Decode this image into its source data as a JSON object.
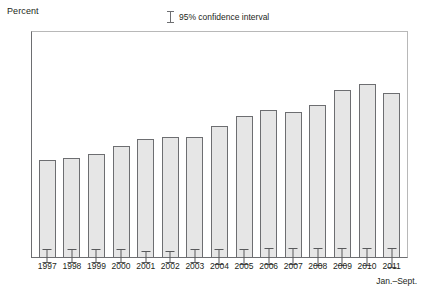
{
  "chart_data": {
    "type": "bar",
    "title": "",
    "xlabel": "",
    "ylabel": "Percent",
    "ylim": [
      0,
      12
    ],
    "yticks": [
      0,
      2,
      4,
      6,
      8,
      10,
      12
    ],
    "ytick_labels": [
      "0",
      "2",
      "4",
      "6",
      "8",
      "10",
      "12"
    ],
    "grid": false,
    "legend_position": "top-center",
    "legend": [
      "95% confidence interval"
    ],
    "categories": [
      "1997",
      "1998",
      "1999",
      "2000",
      "2001",
      "2002",
      "2003",
      "2004",
      "2005",
      "2006",
      "2007",
      "2008",
      "2009",
      "2010",
      "2011"
    ],
    "values": [
      5.2,
      5.3,
      5.5,
      5.9,
      6.3,
      6.4,
      6.4,
      7.0,
      7.5,
      7.8,
      7.7,
      8.1,
      8.9,
      9.2,
      8.7
    ],
    "ci_low": [
      4.9,
      5.0,
      5.2,
      5.6,
      6.0,
      6.1,
      6.1,
      6.6,
      7.1,
      7.4,
      7.3,
      7.6,
      8.4,
      8.7,
      8.1
    ],
    "ci_high": [
      5.6,
      5.7,
      5.9,
      6.3,
      6.6,
      6.7,
      6.8,
      7.4,
      7.9,
      8.3,
      8.2,
      8.6,
      9.4,
      9.7,
      9.2
    ],
    "annotation": "Jan.–Sept.",
    "colors": {
      "bar_fill": "#e6e6e6",
      "bar_border": "#6d6e71",
      "error_bar": "#58595b",
      "axis": "#6d6e71",
      "frame": "#b8b8b8",
      "text": "#231f20"
    }
  },
  "legend": {
    "ci_label": "95% confidence interval"
  },
  "axes": {
    "y_title": "Percent",
    "x_note": "Jan.–Sept."
  }
}
